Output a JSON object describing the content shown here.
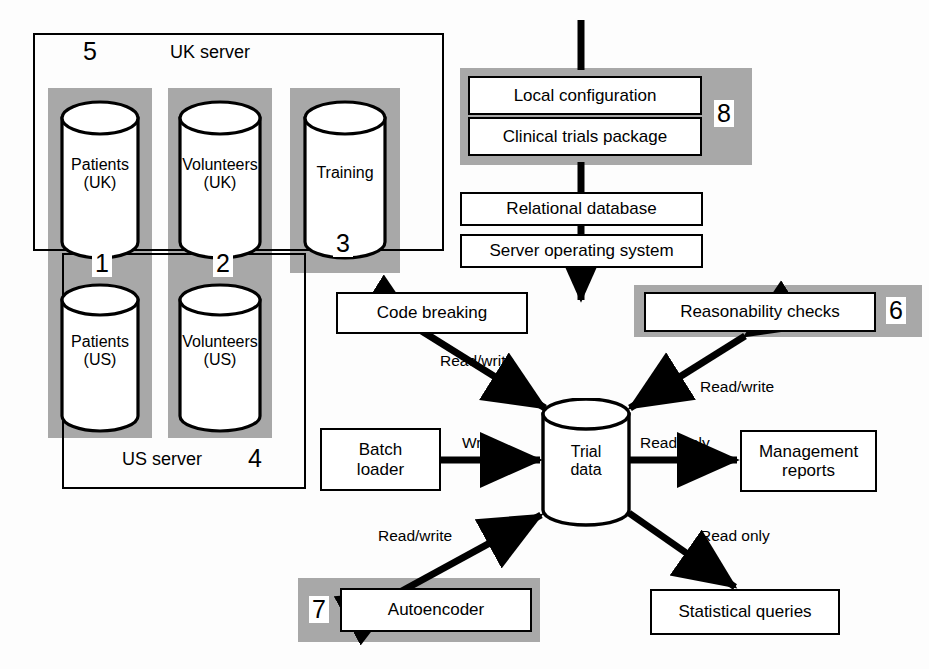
{
  "diagram": {
    "colors": {
      "shade": "#a8a8a8",
      "line": "#000000",
      "fill": "#ffffff"
    }
  },
  "uk_server": {
    "title": "UK server",
    "number": "5",
    "databases": [
      {
        "line1": "Patients",
        "line2": "(UK)",
        "number": "1"
      },
      {
        "line1": "Volunteers",
        "line2": "(UK)",
        "number": "2"
      },
      {
        "line1": "Training",
        "line2": "",
        "number": "3"
      }
    ]
  },
  "us_server": {
    "title": "US server",
    "number": "4",
    "databases": [
      {
        "line1": "Patients",
        "line2": "(US)"
      },
      {
        "line1": "Volunteers",
        "line2": "(US)"
      }
    ]
  },
  "stack": {
    "number": "8",
    "boxes": [
      {
        "label": "Local configuration"
      },
      {
        "label": "Clinical trials package"
      },
      {
        "label": "Relational database"
      },
      {
        "label": "Server operating system"
      }
    ]
  },
  "processes": {
    "code_breaking": "Code breaking",
    "reasonability_checks": "Reasonability checks",
    "reasonability_number": "6",
    "batch_loader_line1": "Batch",
    "batch_loader_line2": "loader",
    "management_reports_line1": "Management",
    "management_reports_line2": "reports",
    "autoencoder": "Autoencoder",
    "autoencoder_number": "7",
    "statistical_queries": "Statistical queries"
  },
  "trial_data": {
    "line1": "Trial",
    "line2": "data"
  },
  "edges": {
    "code_breaking_rw": "Read/write",
    "reasonability_rw": "Read/write",
    "batch_write": "Write",
    "management_read": "Read only",
    "autoencoder_rw": "Read/write",
    "statistical_read": "Read only"
  }
}
